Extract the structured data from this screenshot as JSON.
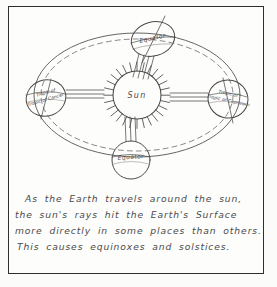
{
  "document": {
    "kind": "hand-drawn-science-diagram",
    "title": "Earth orbit around the Sun",
    "paper_color": "#fdfdfc",
    "ink_color": "#4a4a4a",
    "border_color": "#2f2f2f"
  },
  "diagram": {
    "sun": {
      "label": "Sun",
      "ray_count": 28
    },
    "orbit": {
      "style": "dashed-ellipse",
      "double_outline": true
    },
    "earths": [
      {
        "position": "top",
        "label": "Equator",
        "ray_lines": 4
      },
      {
        "position": "left",
        "label": "Tropic of Cancer",
        "ray_lines": 3
      },
      {
        "position": "right",
        "label": "Tropic of Capricorn",
        "ray_lines": 3
      },
      {
        "position": "bottom",
        "label": "Equator",
        "ray_lines": 3
      }
    ]
  },
  "caption": {
    "lines": [
      "As  the  Earth  travels  around  the  sun,",
      "the  sun's  rays  hit  the Earth's  Surface",
      "more  directly  in some  places  than  others.",
      "This   causes  equinoxes  and  solstices."
    ],
    "full_text": "As the Earth travels around the sun, the sun's rays hit the Earth's Surface more directly in some places than others. This causes equinoxes and solstices."
  }
}
